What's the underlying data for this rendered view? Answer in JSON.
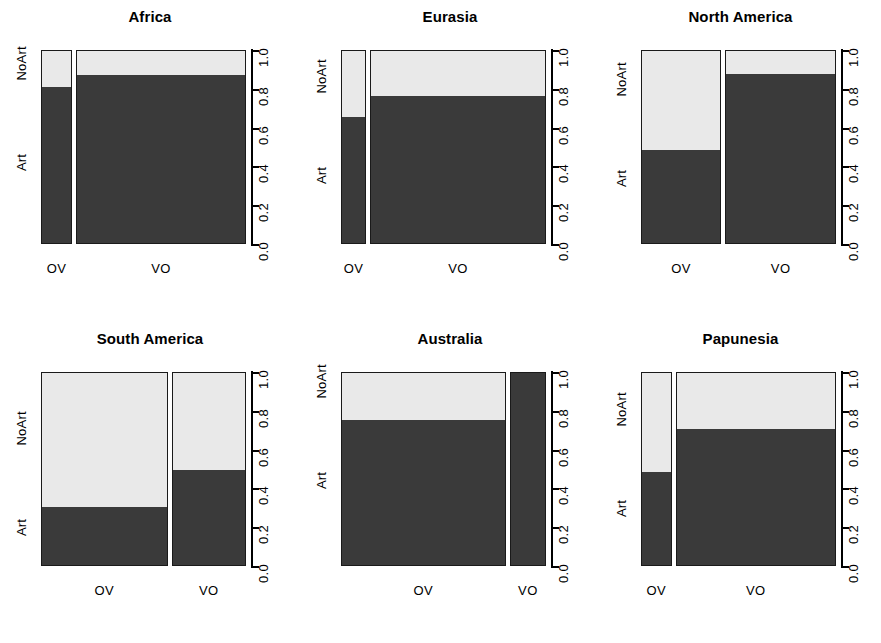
{
  "figure": {
    "type": "mosaic-plot-grid",
    "rows": 2,
    "cols": 3,
    "background": "#ffffff",
    "art_color": "#3a3a3a",
    "noart_color": "#e9e9e9"
  },
  "axis": {
    "y_label_top": "NoArt",
    "y_label_bottom": "Art",
    "y_ticks": [
      "0.0",
      "0.2",
      "0.4",
      "0.6",
      "0.8",
      "1.0"
    ],
    "y_tick_values": [
      0.0,
      0.2,
      0.4,
      0.6,
      0.8,
      1.0
    ],
    "x_categories": [
      "OV",
      "VO"
    ],
    "ylim": [
      0.0,
      1.0
    ]
  },
  "chart_data": {
    "type": "bar",
    "subtype": "mosaic",
    "xlabel": "",
    "ylabel": "",
    "ylim": [
      0,
      1
    ],
    "grid": false,
    "legend": false,
    "categories": [
      "OV",
      "VO"
    ],
    "stack_levels": [
      "Art",
      "NoArt"
    ],
    "panels": [
      {
        "title": "Africa",
        "bars": [
          {
            "label": "OV",
            "width": 0.155,
            "art": 0.805,
            "noart": 0.195
          },
          {
            "label": "VO",
            "width": 0.845,
            "art": 0.865,
            "noart": 0.135
          }
        ]
      },
      {
        "title": "Eurasia",
        "bars": [
          {
            "label": "OV",
            "width": 0.125,
            "art": 0.65,
            "noart": 0.35
          },
          {
            "label": "VO",
            "width": 0.875,
            "art": 0.76,
            "noart": 0.24
          }
        ]
      },
      {
        "title": "North America",
        "bars": [
          {
            "label": "OV",
            "width": 0.42,
            "art": 0.48,
            "noart": 0.52
          },
          {
            "label": "VO",
            "width": 0.58,
            "art": 0.87,
            "noart": 0.13
          }
        ]
      },
      {
        "title": "South America",
        "bars": [
          {
            "label": "OV",
            "width": 0.63,
            "art": 0.3,
            "noart": 0.7
          },
          {
            "label": "VO",
            "width": 0.37,
            "art": 0.49,
            "noart": 0.51
          }
        ]
      },
      {
        "title": "Australia",
        "bars": [
          {
            "label": "OV",
            "width": 0.82,
            "art": 0.745,
            "noart": 0.255
          },
          {
            "label": "VO",
            "width": 0.18,
            "art": 1.0,
            "noart": 0.0
          }
        ]
      },
      {
        "title": "Papunesia",
        "bars": [
          {
            "label": "OV",
            "width": 0.16,
            "art": 0.48,
            "noart": 0.52
          },
          {
            "label": "VO",
            "width": 0.84,
            "art": 0.7,
            "noart": 0.3
          }
        ]
      }
    ]
  }
}
